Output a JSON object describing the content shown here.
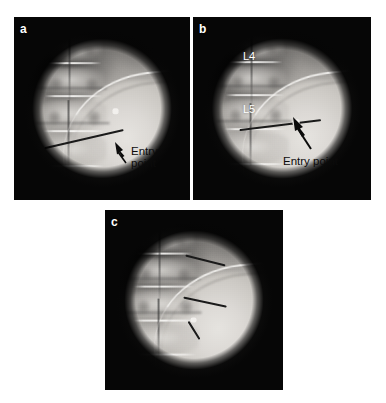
{
  "figure": {
    "background_color": "#ffffff",
    "width": 386,
    "height": 403,
    "modality": "fluoroscopy",
    "anatomy": "lumbar spine"
  },
  "panels": [
    {
      "id": "a",
      "letter": "a",
      "letter_color": "#ffffff",
      "annotation": {
        "text": "Entry\npoint",
        "text_color": "#0b0b0b",
        "arrow": "up-left",
        "arrow_color": "#0b0b0b"
      },
      "level_labels": [],
      "needles": 1
    },
    {
      "id": "b",
      "letter": "b",
      "letter_color": "#ffffff",
      "annotation": {
        "text": "Entry point",
        "text_color": "#0b0b0b",
        "arrow": "up-left",
        "arrow_color": "#0b0b0b"
      },
      "level_labels": [
        {
          "text": "L4",
          "color": "#ffffff"
        },
        {
          "text": "L5",
          "color": "#ffffff"
        }
      ],
      "needles": 1
    },
    {
      "id": "c",
      "letter": "c",
      "letter_color": "#ffffff",
      "annotation": null,
      "level_labels": [],
      "needles": 3
    }
  ]
}
